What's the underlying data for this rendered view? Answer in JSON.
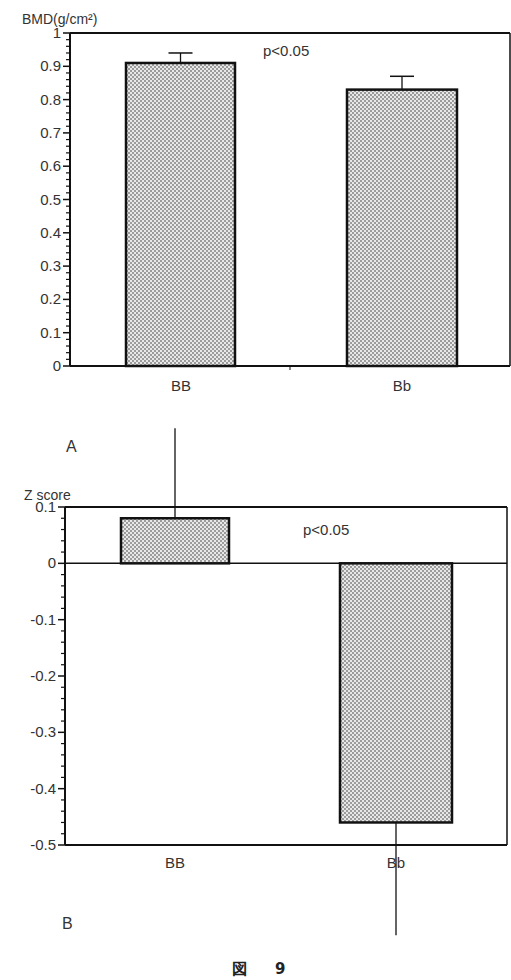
{
  "figure": {
    "caption_prefix": "図",
    "caption_number": "9"
  },
  "chart_data": [
    {
      "type": "bar",
      "panel": "A",
      "title": "",
      "xlabel": "",
      "ylabel": "BMD(g/cm²)",
      "ylim": [
        0,
        1
      ],
      "yticks": [
        0,
        0.1,
        0.2,
        0.3,
        0.4,
        0.5,
        0.6,
        0.7,
        0.8,
        0.9,
        1
      ],
      "ytick_labels": [
        "0",
        "0.1",
        "0.2",
        "0.3",
        "0.4",
        "0.5",
        "0.6",
        "0.7",
        "0.8",
        "0.9",
        "1"
      ],
      "minor_ticks_per_major": 5,
      "categories": [
        "BB",
        "Bb"
      ],
      "values": [
        0.91,
        0.83
      ],
      "error_upper": [
        0.94,
        0.87
      ],
      "annotation": "p<0.05",
      "bar_fill": "stippled gray",
      "grid": false,
      "legend": "none"
    },
    {
      "type": "bar",
      "panel": "B",
      "title": "",
      "xlabel": "",
      "ylabel": "Z score",
      "ylim": [
        -0.5,
        0.1
      ],
      "yticks": [
        0.1,
        0,
        -0.1,
        -0.2,
        -0.3,
        -0.4,
        -0.5
      ],
      "ytick_labels": [
        "0.1",
        "0",
        "-0.1",
        "-0.2",
        "-0.3",
        "-0.4",
        "-0.5"
      ],
      "minor_ticks_per_major": 5,
      "categories": [
        "BB",
        "Bb"
      ],
      "values": [
        0.08,
        -0.46
      ],
      "error_extent": [
        0.24,
        -0.66
      ],
      "annotation": "p<0.05",
      "bar_fill": "stippled gray",
      "grid": false,
      "legend": "none"
    }
  ]
}
